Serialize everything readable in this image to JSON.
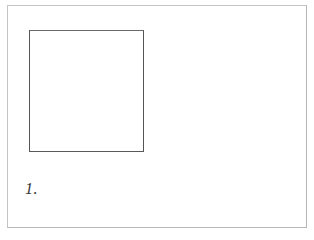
{
  "figure": {
    "label": "1.",
    "shapes": [
      {
        "type": "square",
        "description": "outlined square"
      }
    ]
  },
  "colors": {
    "frame": "#c4c4c4",
    "square_stroke": "#555555",
    "label": "#333333",
    "background": "#ffffff"
  }
}
